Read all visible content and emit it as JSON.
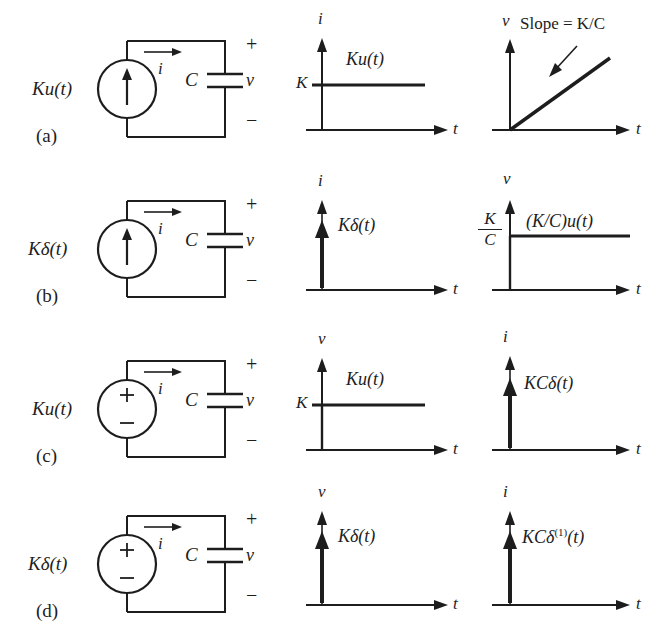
{
  "figure": {
    "type": "circuit-response-diagram",
    "stroke_color": "#1d1d1d",
    "background_color": "#ffffff"
  },
  "rows": [
    {
      "tag": "(a)",
      "source": {
        "label": "Ku(t)",
        "kind": "current-source",
        "arrow": "up"
      },
      "circuit": {
        "mesh_current_label": "i",
        "capacitor_label": "C",
        "voltage_label": "v",
        "plus": "+",
        "minus": "−"
      },
      "plot_mid": {
        "yaxis": "i",
        "xaxis": "t",
        "curve_label": "Ku(t)",
        "level_label": "K",
        "shape": "step"
      },
      "plot_right": {
        "yaxis": "v",
        "xaxis": "t",
        "curve_label": "Slope = K/C",
        "level_label": "",
        "shape": "ramp"
      }
    },
    {
      "tag": "(b)",
      "source": {
        "label": "Kδ(t)",
        "kind": "current-source",
        "arrow": "up"
      },
      "circuit": {
        "mesh_current_label": "i",
        "capacitor_label": "C",
        "voltage_label": "v",
        "plus": "+",
        "minus": "−"
      },
      "plot_mid": {
        "yaxis": "i",
        "xaxis": "t",
        "curve_label": "Kδ(t)",
        "level_label": "",
        "shape": "impulse"
      },
      "plot_right": {
        "yaxis": "v",
        "xaxis": "t",
        "curve_label": "(K/C)u(t)",
        "level_num": "K",
        "level_den": "C",
        "shape": "step"
      }
    },
    {
      "tag": "(c)",
      "source": {
        "label": "Ku(t)",
        "kind": "voltage-source",
        "plus": "+",
        "minus": "−"
      },
      "circuit": {
        "mesh_current_label": "i",
        "capacitor_label": "C",
        "voltage_label": "v",
        "plus": "+",
        "minus": "−"
      },
      "plot_mid": {
        "yaxis": "v",
        "xaxis": "t",
        "curve_label": "Ku(t)",
        "level_label": "K",
        "shape": "step"
      },
      "plot_right": {
        "yaxis": "i",
        "xaxis": "t",
        "curve_label": "KCδ(t)",
        "level_label": "",
        "shape": "impulse"
      }
    },
    {
      "tag": "(d)",
      "source": {
        "label": "Kδ(t)",
        "kind": "voltage-source",
        "plus": "+",
        "minus": "−"
      },
      "circuit": {
        "mesh_current_label": "i",
        "capacitor_label": "C",
        "voltage_label": "v",
        "plus": "+",
        "minus": "−"
      },
      "plot_mid": {
        "yaxis": "v",
        "xaxis": "t",
        "curve_label": "Kδ(t)",
        "level_label": "",
        "shape": "impulse"
      },
      "plot_right": {
        "yaxis": "i",
        "xaxis": "t",
        "curve_label_pre": "KCδ",
        "curve_label_sup": "(1)",
        "curve_label_post": "(t)",
        "shape": "impulse"
      }
    }
  ]
}
